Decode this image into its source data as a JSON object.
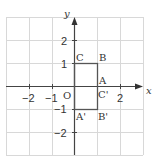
{
  "diagram": {
    "type": "coordinate-grid",
    "axes": {
      "x_label": "x",
      "y_label": "y",
      "origin_label": "O"
    },
    "x_ticks": [
      {
        "value": -2,
        "label": "−2"
      },
      {
        "value": -1,
        "label": "−1"
      },
      {
        "value": 2,
        "label": "2"
      }
    ],
    "y_ticks": [
      {
        "value": 2,
        "label": "2"
      },
      {
        "value": 1,
        "label": "1"
      },
      {
        "value": -1,
        "label": "−1"
      },
      {
        "value": -2,
        "label": "−2"
      }
    ],
    "grid_range": {
      "x": [
        -3,
        3
      ],
      "y": [
        -3,
        3
      ]
    },
    "rectangle": {
      "vertices": [
        [
          0,
          -1
        ],
        [
          1,
          -1
        ],
        [
          1,
          1
        ],
        [
          0,
          1
        ]
      ],
      "stroke": "#555555"
    },
    "points": [
      {
        "label": "C",
        "x": 0,
        "y": 1
      },
      {
        "label": "B",
        "x": 1,
        "y": 1
      },
      {
        "label": "A",
        "x": 1,
        "y": 0
      },
      {
        "label": "C'",
        "x": 1,
        "y": 0
      },
      {
        "label": "A'",
        "x": 0,
        "y": -1
      },
      {
        "label": "B'",
        "x": 1,
        "y": -1
      }
    ],
    "colors": {
      "grid": "#d8d8d8",
      "axis": "#444444",
      "shape": "#555555"
    }
  }
}
